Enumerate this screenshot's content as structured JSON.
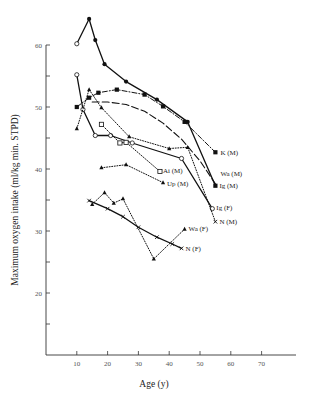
{
  "chart_data": {
    "type": "line",
    "title": "",
    "xlabel": "Age (y)",
    "ylabel": "Maximum oxygen intake (ml/kg min. STPD)",
    "xlim": [
      0,
      80
    ],
    "ylim": [
      10,
      65
    ],
    "xticks": [
      10,
      20,
      30,
      40,
      50,
      60,
      70
    ],
    "yticks": [
      15,
      20,
      25,
      30,
      35,
      40,
      45,
      50,
      55,
      60
    ],
    "ytick_labels": {
      "20": "20",
      "30": "30",
      "40": "40",
      "50": "50",
      "60": "60"
    },
    "grid": false,
    "legend": "inline labels at line ends (right side)",
    "series": [
      {
        "name": "Ig (M)",
        "style": "solid",
        "marker": "filled-circle",
        "points": [
          [
            10,
            60.2,
            "open-circle"
          ],
          [
            14,
            64.2
          ],
          [
            16,
            60.8
          ],
          [
            19,
            56.9
          ],
          [
            26,
            54.1
          ],
          [
            36,
            51.2
          ],
          [
            46,
            47.6
          ],
          [
            55,
            37.3,
            "filled-square"
          ]
        ]
      },
      {
        "name": "K (M)",
        "style": "dash-dot",
        "marker": "filled-square",
        "points": [
          [
            10,
            50.0
          ],
          [
            14,
            51.5
          ],
          [
            17,
            52.3
          ],
          [
            23,
            52.8
          ],
          [
            32,
            52.0
          ],
          [
            38,
            50.1
          ],
          [
            45,
            47.6
          ],
          [
            55,
            42.7
          ]
        ]
      },
      {
        "name": "Wa (M)",
        "style": "long-dash",
        "marker": "none",
        "points": [
          [
            15,
            50.8
          ],
          [
            20,
            50.8
          ],
          [
            26,
            50.4
          ],
          [
            32,
            49.3
          ],
          [
            38,
            47.4
          ],
          [
            44,
            44.8
          ],
          [
            50,
            41.3
          ],
          [
            55,
            37.6
          ]
        ]
      },
      {
        "name": "Ig (F)",
        "style": "solid",
        "marker": "open-circle",
        "points": [
          [
            10,
            55.2
          ],
          [
            12,
            49.6
          ],
          [
            16,
            45.4
          ],
          [
            21,
            45.4
          ],
          [
            28,
            44.2
          ],
          [
            44,
            41.7
          ],
          [
            54,
            33.6
          ]
        ]
      },
      {
        "name": "N (M)",
        "style": "dotted",
        "marker": "filled-triangle",
        "points": [
          [
            10,
            46.5
          ],
          [
            14,
            52.8
          ],
          [
            18,
            49.9
          ],
          [
            27,
            45.2
          ],
          [
            40,
            43.3
          ],
          [
            46,
            43.5
          ],
          [
            55,
            31.5,
            "x"
          ]
        ]
      },
      {
        "name": "Ai (M)",
        "style": "dotted",
        "marker": "open-square",
        "points": [
          [
            18,
            47.2
          ],
          [
            24,
            44.2
          ],
          [
            26,
            44.3
          ],
          [
            37,
            39.6
          ]
        ]
      },
      {
        "name": "Up (M)",
        "style": "dotted",
        "marker": "filled-triangle",
        "points": [
          [
            18,
            40.2
          ],
          [
            26,
            40.7
          ],
          [
            38,
            37.8
          ]
        ]
      },
      {
        "name": "Wa (F)",
        "style": "dotted",
        "marker": "filled-triangle",
        "points": [
          [
            15,
            34.3
          ],
          [
            19,
            36.2
          ],
          [
            22,
            34.5
          ],
          [
            25,
            35.2
          ],
          [
            35,
            25.5
          ],
          [
            45,
            30.3
          ]
        ]
      },
      {
        "name": "N (F)",
        "style": "solid",
        "marker": "x",
        "points": [
          [
            14,
            34.9
          ],
          [
            20,
            33.6
          ],
          [
            25,
            32.3
          ],
          [
            30,
            30.6
          ],
          [
            36,
            29.0
          ],
          [
            41,
            27.9
          ],
          [
            44,
            27.2
          ]
        ]
      }
    ],
    "labels": [
      {
        "text": "K (M)",
        "series": "K (M)"
      },
      {
        "text": "Wa (M)",
        "series": "Wa (M)"
      },
      {
        "text": "Ig (M)",
        "series": "Ig (M)"
      },
      {
        "text": "Ai (M)",
        "series": "Ai (M)"
      },
      {
        "text": "Up (M)",
        "series": "Up (M)"
      },
      {
        "text": "Ig (F)",
        "series": "Ig (F)"
      },
      {
        "text": "N (M)",
        "series": "N (M)"
      },
      {
        "text": "Wa (F)",
        "series": "Wa (F)"
      },
      {
        "text": "N (F)",
        "series": "N (F)"
      }
    ]
  }
}
